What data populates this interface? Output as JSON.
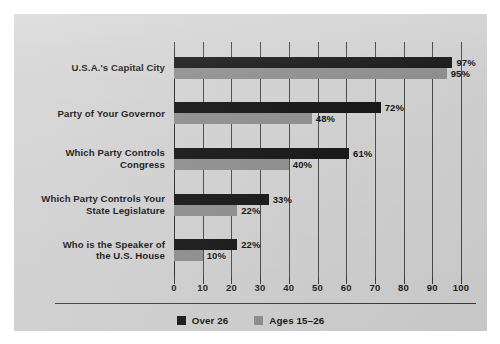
{
  "chart_data": {
    "type": "bar",
    "orientation": "horizontal",
    "title": "",
    "subtitle": "",
    "xlabel": "",
    "ylabel": "",
    "xlim": [
      0,
      100
    ],
    "xticks": [
      "0",
      "10",
      "20",
      "30",
      "40",
      "50",
      "60",
      "70",
      "80",
      "90",
      "100"
    ],
    "grid": true,
    "legend_position": "bottom-center",
    "value_suffix": "%",
    "categories": [
      "U.S.A.'s Capital City",
      "Party of Your Governor",
      "Which Party Controls Congress",
      "Which Party Controls Your State Legislature",
      "Who is the Speaker of the U.S. House"
    ],
    "category_lines": [
      [
        "U.S.A.'s Capital City"
      ],
      [
        "Party of Your Governor"
      ],
      [
        "Which Party Controls",
        "Congress"
      ],
      [
        "Which Party Controls Your",
        "State Legislature"
      ],
      [
        "Who is the Speaker of",
        "the U.S. House"
      ]
    ],
    "series": [
      {
        "name": "Over 26",
        "color": "#131313",
        "values": [
          97,
          72,
          61,
          33,
          22
        ],
        "labels": [
          "97%",
          "72%",
          "61%",
          "33%",
          "22%"
        ]
      },
      {
        "name": "Ages 15–26",
        "color": "#8f8f8f",
        "values": [
          95,
          48,
          40,
          22,
          10
        ],
        "labels": [
          "95%",
          "48%",
          "40%",
          "22%",
          "10%"
        ]
      }
    ]
  },
  "legend": {
    "items": [
      {
        "label": "Over 26",
        "color": "#131313"
      },
      {
        "label": "Ages 15–26",
        "color": "#8f8f8f"
      }
    ]
  },
  "palette": {
    "page_background": "#ffffff",
    "panel_background": "#d4d4d4",
    "series_over26": "#131313",
    "series_ages": "#8f8f8f",
    "axis": "#2b2b2b",
    "gridline": "#4a4a4a",
    "text": "#111111"
  }
}
